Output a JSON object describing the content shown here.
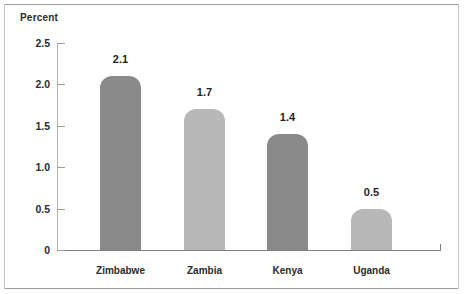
{
  "chart_data": {
    "type": "bar",
    "title": "",
    "subtitle": "",
    "xlabel": "",
    "ylabel": "Percent",
    "categories": [
      "Zimbabwe",
      "Zambia",
      "Kenya",
      "Uganda"
    ],
    "values": [
      2.1,
      1.7,
      1.4,
      0.5
    ],
    "value_labels": [
      "2.1",
      "1.7",
      "1.4",
      "0.5"
    ],
    "bar_colors": [
      "#8a8a8a",
      "#b8b8b8",
      "#8a8a8a",
      "#b8b8b8"
    ],
    "ylim": [
      0,
      2.5
    ],
    "yticks": [
      2.5,
      2.0,
      1.5,
      1.0,
      0.5,
      0
    ],
    "ytick_labels": [
      "2.5",
      "2.0",
      "1.5",
      "1.0",
      "0.5",
      "0"
    ],
    "grid": false,
    "legend": false,
    "legend_position": "none",
    "annotations": []
  },
  "axis": {
    "y_title": "Percent"
  },
  "colors": {
    "bar_dark": "#8a8a8a",
    "bar_light": "#b8b8b8",
    "axis": "#808080",
    "frame": "#9a9a9a",
    "text": "#2b2b2b"
  }
}
